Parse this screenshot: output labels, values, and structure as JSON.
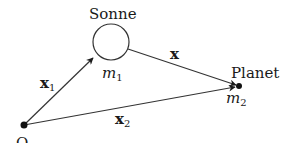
{
  "diagram": {
    "sun": {
      "label": "Sonne",
      "mass_label": "m",
      "mass_sub": "1",
      "center": [
        111,
        42
      ],
      "radius": 18
    },
    "planet": {
      "label": "Planet",
      "mass_label": "m",
      "mass_sub": "2",
      "point": [
        239,
        86
      ]
    },
    "origin": {
      "label": "O",
      "point": [
        24,
        125
      ]
    },
    "vectors": [
      {
        "id": "x1",
        "label": "x",
        "sub": "1",
        "from": "origin",
        "to": "sun"
      },
      {
        "id": "x",
        "label": "x",
        "sub": "",
        "from": "sun",
        "to": "planet"
      },
      {
        "id": "x2",
        "label": "x",
        "sub": "2",
        "from": "origin",
        "to": "planet"
      }
    ],
    "colors": {
      "stroke": "#333333",
      "text": "#1a1a1a",
      "background": "#ffffff"
    }
  }
}
